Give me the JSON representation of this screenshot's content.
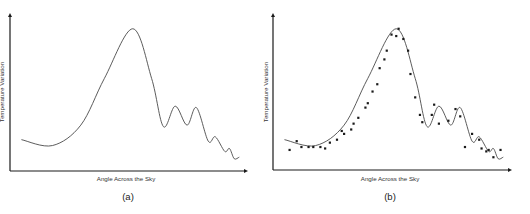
{
  "figure": {
    "panels": [
      {
        "id": "a",
        "panel_label": "(a)",
        "xlabel": "Angle Across the Sky",
        "ylabel": "Temperature Variation"
      },
      {
        "id": "b",
        "panel_label": "(b)",
        "xlabel": "Angle Across the Sky",
        "ylabel": "Temperature Variation"
      }
    ]
  },
  "chart_data": [
    {
      "type": "line",
      "title": "",
      "panel_label": "(a)",
      "xlabel": "Angle Across the Sky",
      "ylabel": "Temperature Variation",
      "grid": false,
      "ticks": false,
      "description": "Smooth theoretical curve: shallow dip, one large peak, then a series of decreasing smaller oscillations",
      "series": [
        {
          "name": "model curve",
          "x": [
            0.05,
            0.18,
            0.3,
            0.4,
            0.52,
            0.6,
            0.65,
            0.7,
            0.75,
            0.79,
            0.84,
            0.87,
            0.91,
            0.93,
            0.95,
            0.97
          ],
          "y": [
            0.18,
            0.14,
            0.28,
            0.6,
            0.94,
            0.6,
            0.27,
            0.41,
            0.28,
            0.4,
            0.17,
            0.2,
            0.1,
            0.12,
            0.05,
            0.06
          ]
        }
      ],
      "xlim": [
        0,
        1
      ],
      "ylim": [
        0,
        1
      ]
    },
    {
      "type": "scatter",
      "title": "",
      "panel_label": "(b)",
      "xlabel": "Angle Across the Sky",
      "ylabel": "Temperature Variation",
      "grid": false,
      "ticks": false,
      "description": "Same model curve overlaid with measured data points that closely follow it",
      "series": [
        {
          "name": "model curve",
          "type": "line",
          "x": [
            0.05,
            0.18,
            0.3,
            0.4,
            0.52,
            0.6,
            0.65,
            0.7,
            0.75,
            0.79,
            0.84,
            0.87,
            0.91,
            0.93,
            0.95,
            0.97
          ],
          "y": [
            0.18,
            0.14,
            0.28,
            0.6,
            0.94,
            0.6,
            0.27,
            0.41,
            0.28,
            0.4,
            0.17,
            0.2,
            0.1,
            0.12,
            0.05,
            0.06
          ]
        },
        {
          "name": "measurements",
          "type": "scatter",
          "x": [
            0.07,
            0.1,
            0.12,
            0.15,
            0.17,
            0.2,
            0.22,
            0.24,
            0.27,
            0.29,
            0.3,
            0.33,
            0.34,
            0.36,
            0.39,
            0.4,
            0.42,
            0.44,
            0.45,
            0.47,
            0.48,
            0.5,
            0.52,
            0.53,
            0.55,
            0.57,
            0.58,
            0.6,
            0.62,
            0.63,
            0.67,
            0.68,
            0.7,
            0.74,
            0.77,
            0.79,
            0.81,
            0.84,
            0.87,
            0.88,
            0.9,
            0.91,
            0.93,
            0.96
          ],
          "y": [
            0.11,
            0.17,
            0.13,
            0.13,
            0.13,
            0.13,
            0.12,
            0.16,
            0.18,
            0.24,
            0.22,
            0.25,
            0.29,
            0.33,
            0.4,
            0.43,
            0.51,
            0.56,
            0.67,
            0.73,
            0.79,
            0.9,
            0.89,
            0.94,
            0.87,
            0.79,
            0.63,
            0.47,
            0.35,
            0.3,
            0.35,
            0.42,
            0.29,
            0.31,
            0.39,
            0.34,
            0.13,
            0.22,
            0.18,
            0.12,
            0.1,
            0.11,
            0.06,
            0.11
          ]
        }
      ],
      "xlim": [
        0,
        1
      ],
      "ylim": [
        0,
        1
      ]
    }
  ]
}
